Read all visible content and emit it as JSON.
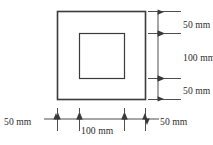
{
  "figure": {
    "type": "engineering-dimension-drawing",
    "units": "mm",
    "line_color": "#3a3a3a",
    "text_color": "#2b2b2b",
    "background_color": "#ffffff"
  },
  "shapes": {
    "outer_square": {
      "name": "outer-square",
      "x": 57.5,
      "y": 11.5,
      "width": 88,
      "height": 88,
      "stroke_width": 1.6
    },
    "inner_square": {
      "name": "inner-square",
      "x": 79.5,
      "y": 33.5,
      "width": 45,
      "height": 45,
      "stroke_width": 1.2
    }
  },
  "vertical_dimensions": {
    "line_x": 158,
    "extension_x1": 148,
    "extension_x2": 181,
    "label_x": 183,
    "segments": [
      {
        "name": "top-margin",
        "label": "50 mm",
        "y_start": 11.5,
        "y_end": 33.5,
        "label_y": 25.5
      },
      {
        "name": "hole-height",
        "label": "100 mm",
        "y_start": 33.5,
        "y_end": 78.5,
        "label_y": 59
      },
      {
        "name": "bottom-margin",
        "label": "50 mm",
        "y_start": 78.5,
        "y_end": 99.5,
        "label_y": 92
      }
    ]
  },
  "horizontal_dimensions": {
    "line_y": 119,
    "extension_y1": 108,
    "extension_y2": 131,
    "extension_x": [
      57.5,
      79.5,
      124.5,
      145.5
    ],
    "left_label": {
      "name": "left-margin",
      "text": "50 mm",
      "x": 4,
      "y": 122.5,
      "leader_from": 44,
      "leader_to": 56
    },
    "center_label": {
      "name": "hole-width",
      "text": "100 mm",
      "x": 81,
      "y": 131.5
    },
    "right_label": {
      "name": "right-margin",
      "text": "50 mm",
      "x": 160,
      "y": 122.5,
      "leader_from": 159,
      "leader_to": 147
    }
  }
}
